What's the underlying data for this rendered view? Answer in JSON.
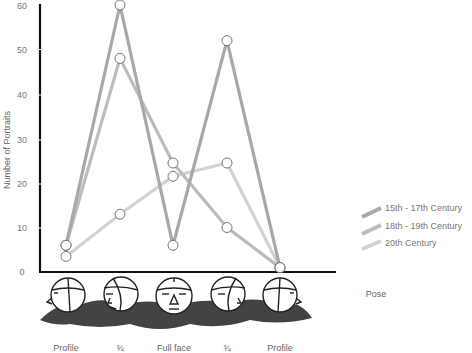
{
  "chart_data": {
    "type": "line",
    "title": "",
    "xlabel": "Pose",
    "ylabel": "Number of Portraits",
    "ylim": [
      0,
      60
    ],
    "yticks": [
      0,
      10,
      20,
      30,
      40,
      50,
      60
    ],
    "grid": false,
    "legend_position": "right",
    "categories": [
      "Profile",
      "¾",
      "Full face",
      "¾",
      "Profile"
    ],
    "series": [
      {
        "name": "15th - 17th Century",
        "color": "#a8a8a8",
        "values": [
          6,
          60,
          6,
          52,
          1
        ]
      },
      {
        "name": "18th - 19th Century",
        "color": "#bcbcbc",
        "values": [
          6,
          48,
          24.5,
          10,
          1
        ]
      },
      {
        "name": "20th Century",
        "color": "#d2d2d2",
        "values": [
          3.5,
          13,
          21.5,
          24.5,
          1
        ]
      }
    ],
    "annotations": [
      "Sketched head illustrations below each pose category"
    ]
  },
  "labels": {
    "y_axis_title": "Number of Portraits",
    "x_axis_title": "Pose",
    "categories": [
      "Profile",
      "¾",
      "Full face",
      "¾",
      "Profile"
    ],
    "yticks": [
      "0",
      "10",
      "20",
      "30",
      "40",
      "50",
      "60"
    ],
    "legend": [
      "15th - 17th Century",
      "18th - 19th Century",
      "20th Century"
    ]
  }
}
